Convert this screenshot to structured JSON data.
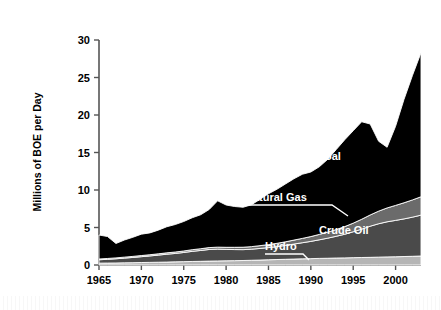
{
  "figure": {
    "background_color": "#ffffff",
    "frame_color": "#6e6e6e"
  },
  "axis": {
    "y_title": "Millions of BOE per Day",
    "y_ticks": [
      "0",
      "5",
      "10",
      "15",
      "20",
      "25",
      "30"
    ],
    "x_ticks": [
      "1965",
      "1970",
      "1975",
      "1980",
      "1985",
      "1990",
      "1995",
      "2000"
    ]
  },
  "labels": {
    "coal": "Coal",
    "natural_gas": "Natural Gas",
    "crude_oil": "Crude Oil",
    "hydro": "Hydro"
  },
  "chart_data": {
    "type": "area",
    "stacked": true,
    "title": "",
    "xlabel": "",
    "ylabel": "Millions of BOE per Day",
    "xlim": [
      1965,
      2003
    ],
    "ylim": [
      0,
      30
    ],
    "yticks": [
      0,
      5,
      10,
      15,
      20,
      25,
      30
    ],
    "xticks": [
      1965,
      1970,
      1975,
      1980,
      1985,
      1990,
      1995,
      2000
    ],
    "grid": false,
    "legend": "inline-annotations",
    "x": [
      1965,
      1966,
      1967,
      1968,
      1969,
      1970,
      1971,
      1972,
      1973,
      1974,
      1975,
      1976,
      1977,
      1978,
      1979,
      1980,
      1981,
      1982,
      1983,
      1984,
      1985,
      1986,
      1987,
      1988,
      1989,
      1990,
      1991,
      1992,
      1993,
      1994,
      1995,
      1996,
      1997,
      1998,
      1999,
      2000,
      2001,
      2002,
      2003
    ],
    "series": [
      {
        "name": "Hydro",
        "color": "#b5b5b5",
        "values": [
          0.25,
          0.26,
          0.27,
          0.29,
          0.31,
          0.33,
          0.35,
          0.37,
          0.39,
          0.42,
          0.45,
          0.47,
          0.49,
          0.52,
          0.54,
          0.56,
          0.58,
          0.6,
          0.63,
          0.66,
          0.7,
          0.73,
          0.76,
          0.79,
          0.82,
          0.85,
          0.88,
          0.9,
          0.93,
          0.95,
          0.98,
          1.0,
          1.02,
          1.05,
          1.08,
          1.1,
          1.13,
          1.16,
          1.2
        ]
      },
      {
        "name": "Crude Oil",
        "color": "#4a4a4a",
        "values": [
          0.45,
          0.5,
          0.56,
          0.63,
          0.7,
          0.78,
          0.86,
          0.95,
          1.05,
          1.12,
          1.22,
          1.35,
          1.45,
          1.55,
          1.58,
          1.52,
          1.48,
          1.45,
          1.48,
          1.55,
          1.62,
          1.72,
          1.85,
          2.0,
          2.15,
          2.3,
          2.48,
          2.68,
          2.9,
          3.15,
          3.45,
          3.78,
          4.15,
          4.45,
          4.68,
          4.85,
          5.02,
          5.22,
          5.45
        ]
      },
      {
        "name": "Natural Gas",
        "color": "#6b6b6b",
        "values": [
          0.1,
          0.11,
          0.12,
          0.13,
          0.14,
          0.15,
          0.16,
          0.17,
          0.18,
          0.19,
          0.2,
          0.22,
          0.23,
          0.25,
          0.26,
          0.28,
          0.3,
          0.32,
          0.34,
          0.37,
          0.4,
          0.44,
          0.48,
          0.53,
          0.58,
          0.64,
          0.72,
          0.8,
          0.9,
          1.02,
          1.15,
          1.32,
          1.5,
          1.68,
          1.85,
          2.0,
          2.15,
          2.3,
          2.45
        ]
      },
      {
        "name": "Coal",
        "color": "#000000",
        "values": [
          3.2,
          2.93,
          1.92,
          2.28,
          2.55,
          2.85,
          2.91,
          3.16,
          3.48,
          3.67,
          3.93,
          4.26,
          4.53,
          5.08,
          6.18,
          5.64,
          5.44,
          5.33,
          5.58,
          6.18,
          6.78,
          7.21,
          7.71,
          8.18,
          8.55,
          8.61,
          9.02,
          9.72,
          10.67,
          11.58,
          12.32,
          13.0,
          12.13,
          9.32,
          8.09,
          10.55,
          13.8,
          16.62,
          19.2
        ]
      }
    ],
    "series_totals": [
      4.0,
      3.8,
      2.87,
      3.33,
      3.7,
      4.11,
      4.28,
      4.65,
      5.1,
      5.4,
      5.8,
      6.3,
      6.7,
      7.4,
      8.56,
      8.0,
      7.8,
      7.7,
      8.03,
      8.76,
      9.5,
      10.1,
      10.8,
      11.5,
      12.1,
      12.4,
      13.1,
      14.1,
      15.4,
      16.7,
      17.9,
      19.1,
      18.8,
      16.5,
      15.7,
      18.5,
      22.1,
      25.3,
      28.3
    ]
  }
}
